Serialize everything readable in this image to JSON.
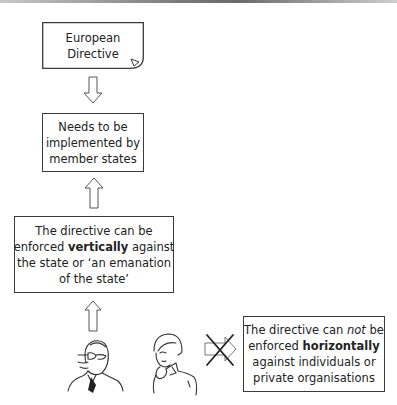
{
  "diagram": {
    "nodes": {
      "directive": {
        "line1": "European",
        "line2": "Directive"
      },
      "implementation": {
        "line1": "Needs to be",
        "line2": "implemented by",
        "line3": "member states"
      },
      "vertical": {
        "line1": "The directive can be",
        "line2_pre": "enforced ",
        "line2_bold": "vertically",
        "line2_post": " against",
        "line3": "the state or ‘an emanation",
        "line4": "of the state’"
      },
      "horizontal": {
        "line1_pre": "The directive can ",
        "line1_italic": "not",
        "line1_post": " be",
        "line2_pre": "enforced ",
        "line2_bold": "horizontally",
        "line3": "against individuals or",
        "line4": "private organisations"
      }
    },
    "edges": [
      {
        "from": "directive",
        "to": "implementation",
        "type": "hollow-arrow-down"
      },
      {
        "from": "vertical",
        "to": "implementation",
        "type": "hollow-arrow-up"
      },
      {
        "from": "state-official",
        "to": "vertical",
        "type": "hollow-arrow-up"
      },
      {
        "from": "individual",
        "to": "horizontal",
        "type": "crossed-out-arrow-right"
      }
    ],
    "figures": [
      "man-with-glasses-suit",
      "woman-individual"
    ],
    "colors": {
      "stroke": "#3a3a3a",
      "background": "#ffffff"
    }
  }
}
